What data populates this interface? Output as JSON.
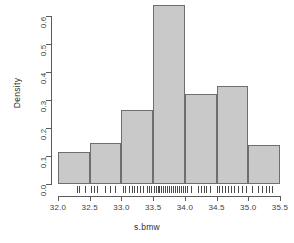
{
  "chart_data": {
    "type": "bar",
    "subtype": "histogram",
    "title": "",
    "xlabel": "s.bmw",
    "ylabel": "Density",
    "xlim": [
      32.0,
      35.5
    ],
    "ylim": [
      0.0,
      0.65
    ],
    "grid": false,
    "legend": null,
    "bin_width": 0.5,
    "bin_edges": [
      32.0,
      32.5,
      33.0,
      33.5,
      34.0,
      34.5,
      35.0,
      35.5
    ],
    "categories": [
      "32.0-32.5",
      "32.5-33.0",
      "33.0-33.5",
      "33.5-34.0",
      "34.0-34.5",
      "34.5-35.0",
      "35.0-35.5"
    ],
    "values": [
      0.115,
      0.145,
      0.265,
      0.64,
      0.32,
      0.35,
      0.14
    ],
    "xticks": [
      "32.0",
      "32.5",
      "33.0",
      "33.5",
      "34.0",
      "34.5",
      "35.0",
      "35.5"
    ],
    "xtick_values": [
      32.0,
      32.5,
      33.0,
      33.5,
      34.0,
      34.5,
      35.0,
      35.5
    ],
    "yticks": [
      "0.0",
      "0.1",
      "0.2",
      "0.3",
      "0.4",
      "0.5",
      "0.6"
    ],
    "ytick_values": [
      0.0,
      0.1,
      0.2,
      0.3,
      0.4,
      0.5,
      0.6
    ],
    "bar_fill_color": "#c9c9c9",
    "bar_border_color": "#6e6e6e",
    "axis_color": "#5a5a5a",
    "rug_color": "#4a4a4a",
    "rug_values": [
      32.3,
      32.33,
      32.42,
      32.52,
      32.56,
      32.62,
      32.74,
      32.82,
      32.9,
      33.02,
      33.06,
      33.12,
      33.16,
      33.2,
      33.24,
      33.3,
      33.34,
      33.4,
      33.44,
      33.47,
      33.52,
      33.55,
      33.58,
      33.6,
      33.63,
      33.66,
      33.69,
      33.72,
      33.75,
      33.78,
      33.81,
      33.84,
      33.87,
      33.9,
      33.94,
      33.97,
      34.0,
      34.04,
      34.1,
      34.2,
      34.26,
      34.3,
      34.34,
      34.4,
      34.5,
      34.54,
      34.58,
      34.64,
      34.68,
      34.72,
      34.78,
      34.84,
      34.9,
      34.96,
      35.06,
      35.16,
      35.22,
      35.28,
      35.32,
      35.38
    ]
  }
}
